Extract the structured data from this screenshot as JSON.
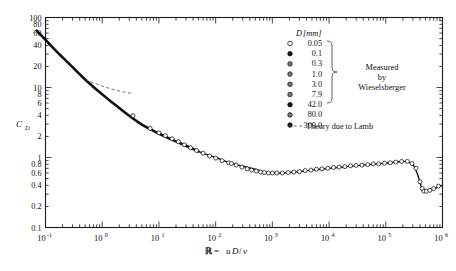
{
  "chart_data": {
    "type": "line",
    "title": "",
    "xlabel": "ℝ = uD/ν",
    "ylabel": "C_D",
    "xscale": "log",
    "yscale": "log",
    "xlim": [
      0.1,
      1000000
    ],
    "ylim": [
      0.1,
      100
    ],
    "grid": false,
    "legend_position": "top-right-inside",
    "x_tick_labels": [
      "10⁻¹",
      "10⁰",
      "10¹",
      "10²",
      "10³",
      "10⁴",
      "10⁵",
      "10⁶"
    ],
    "x_tick_values": [
      0.1,
      1,
      10,
      100,
      1000,
      10000,
      100000,
      1000000
    ],
    "y_tick_labels": [
      "100",
      "80",
      "60",
      "40",
      "20",
      "10",
      "8",
      "6",
      "4",
      "2",
      "1",
      "0.8",
      "0.6",
      "0.4",
      "0.2",
      "0.1"
    ],
    "y_tick_values": [
      100,
      80,
      60,
      40,
      20,
      10,
      8,
      6,
      4,
      2,
      1,
      0.8,
      0.6,
      0.4,
      0.2,
      0.1
    ],
    "series": [
      {
        "name": "Experimental drag curve (sphere)",
        "style": "solid-thick",
        "x": [
          0.07,
          0.1,
          0.15,
          0.2,
          0.3,
          0.5,
          0.7,
          1.0,
          1.5,
          2.0,
          3.0,
          5.0,
          7.0,
          10.0,
          15.0,
          20.0,
          30.0,
          50.0,
          70.0,
          100.0,
          150.0,
          200.0,
          300.0,
          500.0,
          700.0,
          1000.0,
          1500.0,
          2000.0,
          3000.0,
          5000.0,
          7000.0,
          10000.0,
          20000.0,
          40000.0,
          70000.0,
          100000.0,
          150000.0,
          200000.0,
          250000.0,
          300000.0,
          350000.0,
          400000.0,
          430000.0,
          460000.0,
          500000.0,
          600000.0,
          800000.0,
          1000000.0
        ],
        "y": [
          65.0,
          48.0,
          34.0,
          27.0,
          19.5,
          13.0,
          10.2,
          8.0,
          6.1,
          5.1,
          3.95,
          2.95,
          2.55,
          2.2,
          1.88,
          1.7,
          1.47,
          1.22,
          1.1,
          1.0,
          0.88,
          0.82,
          0.75,
          0.68,
          0.63,
          0.6,
          0.6,
          0.61,
          0.63,
          0.66,
          0.68,
          0.7,
          0.74,
          0.78,
          0.81,
          0.83,
          0.86,
          0.88,
          0.86,
          0.8,
          0.62,
          0.45,
          0.36,
          0.33,
          0.33,
          0.34,
          0.37,
          0.4
        ]
      },
      {
        "name": "Theory due to Lamb",
        "style": "dashed",
        "x": [
          0.5,
          0.8,
          1.2,
          1.8,
          2.6,
          3.6
        ],
        "y": [
          13.0,
          11.2,
          10.0,
          9.1,
          8.5,
          8.2
        ]
      }
    ],
    "data_points": {
      "name": "Wieselsberger measurements",
      "x": [
        3.5,
        7.0,
        10.0,
        13.0,
        17.0,
        22.0,
        28.0,
        36.0,
        46.0,
        60.0,
        78.0,
        100.0,
        130.0,
        170.0,
        190.0,
        230.0,
        290.0,
        360.0,
        430.0,
        520.0,
        620.0,
        720.0,
        850.0,
        1000.0,
        1200.0,
        1500.0,
        1900.0,
        2400.0,
        3000.0,
        3800.0,
        4800.0,
        6000.0,
        7500.0,
        9500.0,
        12000.0,
        15000.0,
        19000.0,
        24000.0,
        30000.0,
        38000.0,
        48000.0,
        60000.0,
        75000.0,
        95000.0,
        120000.0,
        150000.0,
        190000.0,
        240000.0,
        290000.0,
        340000.0,
        400000.0,
        440000.0,
        470000.0,
        520000.0,
        600000.0,
        700000.0,
        850000.0
      ],
      "y": [
        3.95,
        2.6,
        2.25,
        2.05,
        1.85,
        1.68,
        1.52,
        1.38,
        1.26,
        1.15,
        1.05,
        0.98,
        0.9,
        0.84,
        0.82,
        0.78,
        0.73,
        0.69,
        0.66,
        0.64,
        0.62,
        0.61,
        0.6,
        0.6,
        0.6,
        0.6,
        0.61,
        0.62,
        0.63,
        0.65,
        0.66,
        0.68,
        0.69,
        0.7,
        0.72,
        0.73,
        0.74,
        0.76,
        0.77,
        0.78,
        0.79,
        0.81,
        0.81,
        0.83,
        0.84,
        0.86,
        0.88,
        0.88,
        0.82,
        0.7,
        0.45,
        0.36,
        0.33,
        0.33,
        0.34,
        0.36,
        0.39
      ]
    }
  },
  "axes": {
    "y_label": "C",
    "y_label_sub": "D",
    "x_label_symbol": "ℝ",
    "x_label_equals": " = ",
    "x_label_expr_u": "u",
    "x_label_expr_D": "D",
    "x_label_expr_slash": "/",
    "x_label_expr_nu": "ν"
  },
  "legend": {
    "header_symbol": "D",
    "header_unit": "[mm]",
    "entries": [
      {
        "value": "0.05",
        "marker": "open-circle"
      },
      {
        "value": "0.1",
        "marker": "filled-circle"
      },
      {
        "value": "0.3",
        "marker": "half-circle"
      },
      {
        "value": "1.0",
        "marker": "dotted-circle"
      },
      {
        "value": "3.0",
        "marker": "crossed-circle"
      },
      {
        "value": "7.9",
        "marker": "quartered-circle"
      },
      {
        "value": "42.0",
        "marker": "filled-circle"
      },
      {
        "value": "80.0",
        "marker": "half-circle"
      },
      {
        "value": "300.0",
        "marker": "filled-circle"
      }
    ],
    "measured_line1": "Measured",
    "measured_line2": "by",
    "measured_line3": "Wieselsberger",
    "theory_label": "Theory due to Lamb"
  },
  "colors": {
    "ink": "#111111",
    "background": "#ffffff",
    "theory_dash": "#555555"
  }
}
